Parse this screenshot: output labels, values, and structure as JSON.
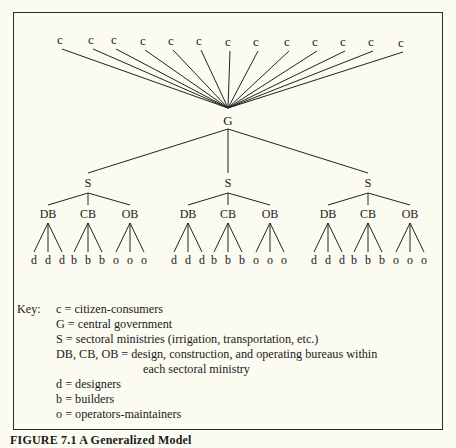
{
  "diagram": {
    "root_children": [
      "c",
      "c",
      "c",
      "c",
      "c",
      "c",
      "c",
      "c",
      "c",
      "c",
      "c",
      "c",
      "c"
    ],
    "central_node": "G",
    "sector_node": "S",
    "bureaus": [
      "DB",
      "CB",
      "OB"
    ],
    "leaves": {
      "DB": [
        "d",
        "d",
        "d"
      ],
      "CB": [
        "b",
        "b",
        "b"
      ],
      "OB": [
        "o",
        "o",
        "o"
      ]
    },
    "sector_count": 3
  },
  "key": {
    "label": "Key:",
    "entries": [
      "c = citizen-consumers",
      "G = central government",
      "S = sectoral ministries (irrigation, transportation, etc.)",
      "DB, CB, OB = design, construction, and operating bureaus within",
      "each sectoral ministry",
      "d = designers",
      "b = builders",
      "o = operators-maintainers"
    ]
  },
  "caption": "FIGURE 7.1 A Generalized Model"
}
